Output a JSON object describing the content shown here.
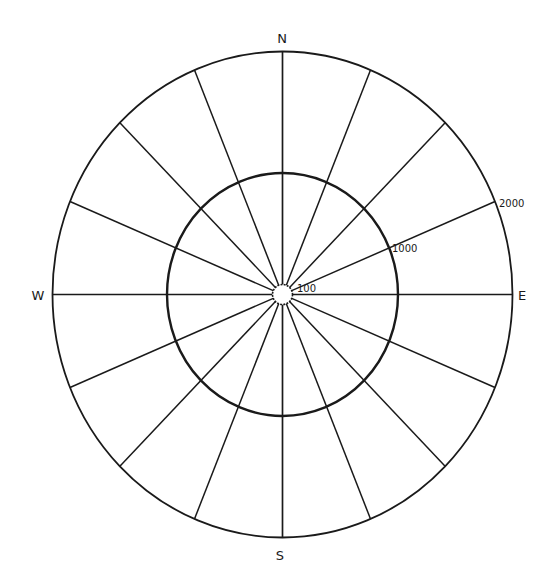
{
  "diagram": {
    "type": "polar-grid",
    "center": {
      "x": 282.5,
      "y": 294.5
    },
    "spoke_count": 16,
    "colors": {
      "background": "#ffffff",
      "line": "#1a1a1a"
    },
    "rings": [
      {
        "label": "100",
        "rx": 10,
        "ry": 10,
        "stroke_width": 1.6,
        "dashed": true,
        "label_pos": {
          "x": 297,
          "y": 292
        }
      },
      {
        "label": "1000",
        "rx": 115.5,
        "ry": 121.5,
        "stroke_width": 2.4,
        "dashed": false,
        "label_pos": {
          "x": 392,
          "y": 252
        }
      },
      {
        "label": "2000",
        "rx": 230,
        "ry": 243,
        "stroke_width": 1.8,
        "dashed": false,
        "label_pos": {
          "x": 499,
          "y": 207
        }
      }
    ],
    "compass": [
      {
        "label": "N",
        "x": 282,
        "y": 43
      },
      {
        "label": "E",
        "x": 522,
        "y": 300
      },
      {
        "label": "S",
        "x": 280,
        "y": 560
      },
      {
        "label": "W",
        "x": 38,
        "y": 300
      }
    ]
  }
}
